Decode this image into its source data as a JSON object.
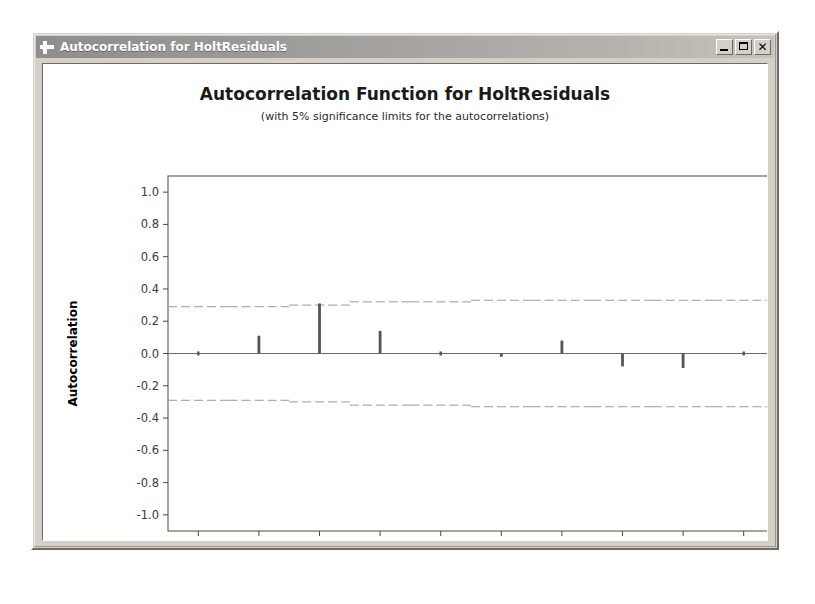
{
  "window": {
    "title": "Autocorrelation for HoltResiduals",
    "icon": "plus-cross-icon",
    "controls": {
      "minimize_label": "_",
      "maximize_label": "□",
      "close_label": "✕"
    }
  },
  "chart_data": {
    "type": "bar",
    "title": "Autocorrelation Function for HoltResiduals",
    "subtitle": "(with 5% significance limits for the autocorrelations)",
    "xlabel": "Lag",
    "ylabel": "Autocorrelation",
    "xlim": [
      0.5,
      10.5
    ],
    "ylim": [
      -1.1,
      1.1
    ],
    "grid": false,
    "legend": null,
    "x_ticks": [
      "1",
      "2",
      "3",
      "4",
      "5",
      "6",
      "7",
      "8",
      "9",
      "10"
    ],
    "y_ticks": [
      "1.0",
      "0.8",
      "0.6",
      "0.4",
      "0.2",
      "0.0",
      "-0.2",
      "-0.4",
      "-0.6",
      "-0.8",
      "-1.0"
    ],
    "categories": [
      1,
      2,
      3,
      4,
      5,
      6,
      7,
      8,
      9,
      10
    ],
    "values": [
      0.0,
      0.11,
      0.31,
      0.14,
      0.0,
      -0.02,
      0.08,
      -0.08,
      -0.09,
      0.0
    ],
    "significance_limits": {
      "upper": [
        0.29,
        0.29,
        0.3,
        0.32,
        0.32,
        0.33,
        0.33,
        0.33,
        0.33,
        0.33
      ],
      "lower": [
        -0.29,
        -0.29,
        -0.3,
        -0.32,
        -0.32,
        -0.33,
        -0.33,
        -0.33,
        -0.33,
        -0.33
      ],
      "style": "dashed",
      "color": "#9a9a9a"
    },
    "zero_line": 0.0,
    "series_color": "#555555"
  }
}
